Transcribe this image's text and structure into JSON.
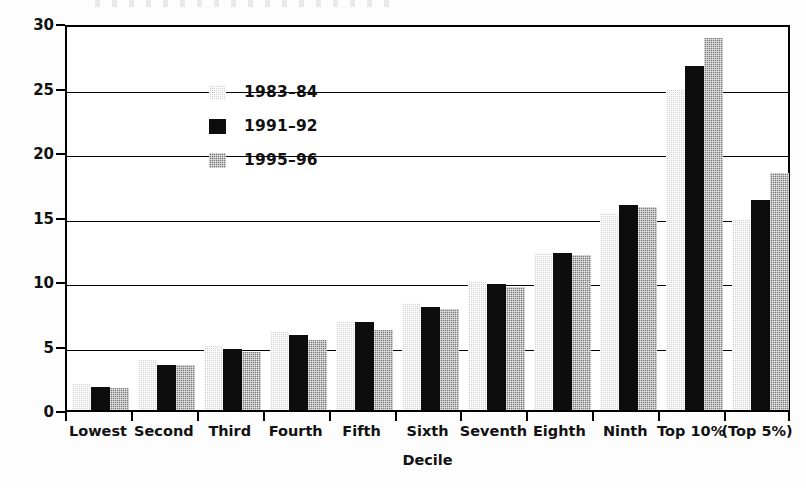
{
  "chart_data": {
    "type": "bar",
    "title": "",
    "xlabel": "Decile",
    "ylabel": "Share (percent)",
    "ylim": [
      0,
      30
    ],
    "yticks": [
      0,
      5,
      10,
      15,
      20,
      25,
      30
    ],
    "grid": true,
    "legend_position": "upper left (inside plot)",
    "categories": [
      "Lowest",
      "Second",
      "Third",
      "Fourth",
      "Fifth",
      "Sixth",
      "Seventh",
      "Eighth",
      "Ninth",
      "Top 10%",
      "(Top 5%)"
    ],
    "series": [
      {
        "name": "1983-84",
        "label": "1983–84",
        "color": "#d2d2d2",
        "pattern": "light-dotted",
        "values": [
          2.0,
          3.9,
          5.0,
          6.1,
          6.9,
          8.3,
          10.0,
          12.2,
          15.3,
          24.8,
          14.8
        ]
      },
      {
        "name": "1991-92",
        "label": "1991–92",
        "color": "#0d0d0d",
        "pattern": "solid-black",
        "values": [
          1.8,
          3.5,
          4.7,
          5.8,
          6.8,
          8.0,
          9.8,
          12.2,
          15.9,
          26.7,
          16.3
        ]
      },
      {
        "name": "1995-96",
        "label": "1995–96",
        "color": "#7a7a7a",
        "pattern": "dark-dotted",
        "values": [
          1.7,
          3.5,
          4.5,
          5.4,
          6.2,
          7.8,
          9.5,
          12.0,
          15.7,
          28.8,
          18.4
        ]
      }
    ]
  },
  "axes": {
    "y_title": "Share (percent)",
    "x_title": "Decile",
    "y_tick_labels": [
      "0",
      "5",
      "10",
      "15",
      "20",
      "25",
      "30"
    ]
  },
  "legend": {
    "entries": [
      {
        "label": "1983–84",
        "swatch": "light-dotted-swatch"
      },
      {
        "label": "1991–92",
        "swatch": "black-swatch"
      },
      {
        "label": "1995–96",
        "swatch": "dark-dotted-swatch"
      }
    ]
  }
}
